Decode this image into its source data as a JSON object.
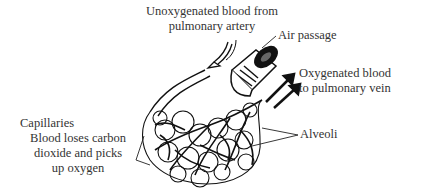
{
  "diagram": {
    "labels": {
      "unoxygenated_line1": "Unoxygenated blood from",
      "unoxygenated_line2": "pulmonary artery",
      "air_passage": "Air passage",
      "oxygenated_line1": "Oxygenated blood",
      "oxygenated_line2": "to pulmonary vein",
      "capillaries": "Capillaries",
      "capillaries_desc_line1": "Blood loses carbon",
      "capillaries_desc_line2": "dioxide and picks",
      "capillaries_desc_line3": "up oxygen",
      "alveoli": "Alveoli"
    },
    "colors": {
      "ink": "#111111",
      "text": "#333333",
      "background": "#ffffff"
    }
  }
}
